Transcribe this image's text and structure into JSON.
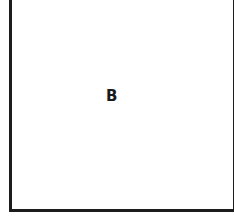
{
  "diagram": {
    "region_label": "B",
    "border_color": "#1c1c1c",
    "background_color": "#ffffff"
  }
}
